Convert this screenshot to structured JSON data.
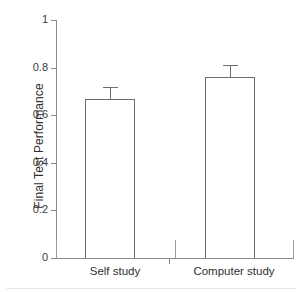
{
  "chart_data": {
    "type": "bar",
    "title": "",
    "subtitle": "",
    "xlabel": "",
    "ylabel": "Final Test Performance",
    "categories": [
      "Self study",
      "Computer study"
    ],
    "values": [
      0.67,
      0.76
    ],
    "errors": [
      0.05,
      0.05
    ],
    "error_type": "standard error bars (upper only shown)",
    "ylim": [
      0,
      1
    ],
    "yticks": [
      0,
      0.2,
      0.4,
      0.6,
      0.8,
      1
    ],
    "ytick_labels": [
      "0",
      "0.2",
      "0.4",
      "0.6",
      "0.8",
      "1"
    ],
    "grid": false,
    "legend": null,
    "annotations": [],
    "series": [
      {
        "name": "Final Test Performance",
        "values": [
          0.67,
          0.76
        ],
        "errors": [
          0.05,
          0.05
        ]
      }
    ]
  },
  "axes": {
    "y_title": "Final Test Performance",
    "y_ticks": [
      {
        "label": "1",
        "value": 1.0
      },
      {
        "label": "0.8",
        "value": 0.8
      },
      {
        "label": "0.6",
        "value": 0.6
      },
      {
        "label": "0.4",
        "value": 0.4
      },
      {
        "label": "0.2",
        "value": 0.2
      },
      {
        "label": "0",
        "value": 0.0
      }
    ],
    "x_ticks": [
      {
        "label": "Self study"
      },
      {
        "label": "Computer study"
      }
    ]
  },
  "bars": [
    {
      "name": "self-study",
      "label": "Self study",
      "value": 0.67,
      "error": 0.05,
      "fill": "#ffffff",
      "stroke": "#6f6f6f"
    },
    {
      "name": "computer-study",
      "label": "Computer study",
      "value": 0.76,
      "error": 0.05,
      "fill": "#ffffff",
      "stroke": "#6f6f6f"
    }
  ],
  "colors": {
    "axis": "#8a8a8a",
    "text": "#2f2f2f",
    "bar_stroke": "#6f6f6f",
    "bar_fill": "#ffffff",
    "background": "#ffffff"
  }
}
